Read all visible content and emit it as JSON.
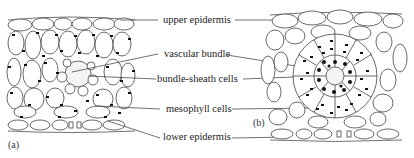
{
  "figure": {
    "panels": [
      {
        "id": "a",
        "tag": "(a)",
        "description": "leaf cross-section, mesophyll arranged loosely around vascular bundle"
      },
      {
        "id": "b",
        "tag": "(b)",
        "description": "leaf cross-section, Kranz anatomy with radial mesophyll around bundle-sheath cells"
      }
    ],
    "labels": {
      "upper_epidermis": "upper epidermis",
      "vascular_bundle": "vascular bundle",
      "bundle_sheath": "bundle-sheath cells",
      "mesophyll": "mesophyll cells",
      "lower_epidermis": "lower epidermis"
    },
    "colors": {
      "line": "#444444",
      "chloroplast": "#111111",
      "background": "#ffffff"
    }
  }
}
